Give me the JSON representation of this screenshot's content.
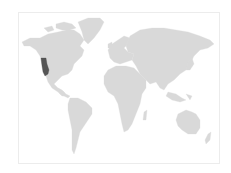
{
  "map": {
    "type": "world-choropleth",
    "colors": {
      "background": "#ffffff",
      "frame_border": "#ececec",
      "land": "#d9d9d9",
      "highlight": "#555555"
    },
    "highlighted_regions": [
      {
        "name": "California",
        "country": "United States",
        "color": "#555555"
      }
    ],
    "continents": [
      "North America",
      "Greenland",
      "South America",
      "Europe",
      "Africa",
      "Asia",
      "Australia",
      "Antarctica-excluded"
    ]
  }
}
